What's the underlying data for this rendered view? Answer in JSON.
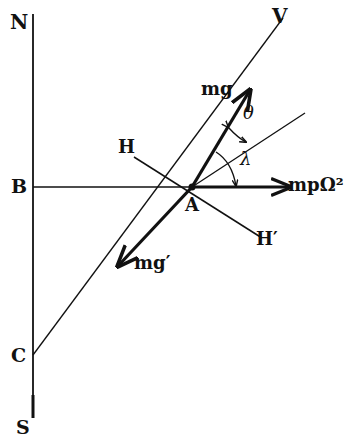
{
  "diagram": {
    "type": "force-diagram",
    "labels": {
      "north": "N",
      "south": "S",
      "point_b": "B",
      "point_c": "C",
      "point_a": "A",
      "vertical": "V",
      "horizontal": "H",
      "horizontal_prime": "H′",
      "gravity": "mg",
      "gravity_effective": "mg′",
      "centrifugal": "mpΩ²",
      "theta": "θ",
      "lambda": "λ"
    },
    "colors": {
      "ink": "#111111",
      "background": "#ffffff"
    }
  }
}
